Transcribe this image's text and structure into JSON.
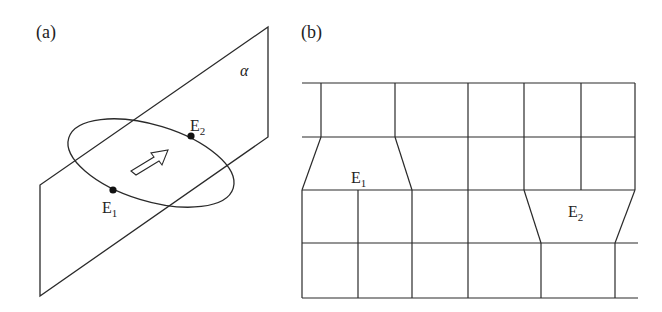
{
  "panel_a": {
    "label": "(a)",
    "plane_label": "α",
    "point_1": {
      "name": "E",
      "sub": "1"
    },
    "point_2": {
      "name": "E",
      "sub": "2"
    },
    "arrow": "hollow-arrow-up-right"
  },
  "panel_b": {
    "label": "(b)",
    "element_1": {
      "name": "E",
      "sub": "1"
    },
    "element_2": {
      "name": "E",
      "sub": "2"
    }
  },
  "colors": {
    "stroke": "#2a2a2a",
    "background": "#ffffff"
  }
}
